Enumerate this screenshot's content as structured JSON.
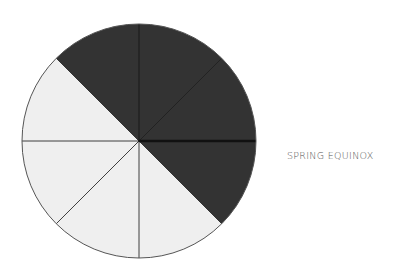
{
  "diagram": {
    "title": "Spring Equinox",
    "label": "SPRING EQUINOX",
    "center": [
      139,
      141
    ],
    "radius": 117,
    "segments": [
      {
        "index": 0,
        "from_deg": -135,
        "to_deg": -90,
        "shade": "dark"
      },
      {
        "index": 1,
        "from_deg": -90,
        "to_deg": -45,
        "shade": "dark"
      },
      {
        "index": 2,
        "from_deg": -45,
        "to_deg": 0,
        "shade": "dark"
      },
      {
        "index": 3,
        "from_deg": 0,
        "to_deg": 45,
        "shade": "dark"
      },
      {
        "index": 4,
        "from_deg": 45,
        "to_deg": 90,
        "shade": "light"
      },
      {
        "index": 5,
        "from_deg": 90,
        "to_deg": 135,
        "shade": "light"
      },
      {
        "index": 6,
        "from_deg": 135,
        "to_deg": 180,
        "shade": "light"
      },
      {
        "index": 7,
        "from_deg": 180,
        "to_deg": 225,
        "shade": "light"
      }
    ],
    "colors": {
      "dark": "#333333",
      "light": "#efefef",
      "outline": "#555555",
      "divider": "#111111"
    }
  }
}
